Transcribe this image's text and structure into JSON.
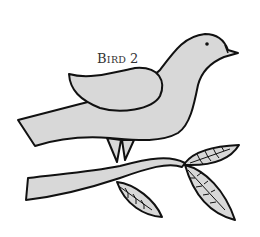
{
  "illustration": {
    "title": "Bird 2",
    "caption_first_letter": "B",
    "caption_rest": "IRD",
    "caption_number": "2",
    "subject": "bird perched on a leafy branch",
    "colors": {
      "fill": "#d8d8d8",
      "stroke": "#111111",
      "background": "#ffffff"
    },
    "elements": [
      "bird-body",
      "bird-wing",
      "bird-tail",
      "bird-eye",
      "bird-beak",
      "bird-legs",
      "branch",
      "leaf-upper-right",
      "leaf-lower-right",
      "leaf-lower-middle"
    ]
  }
}
